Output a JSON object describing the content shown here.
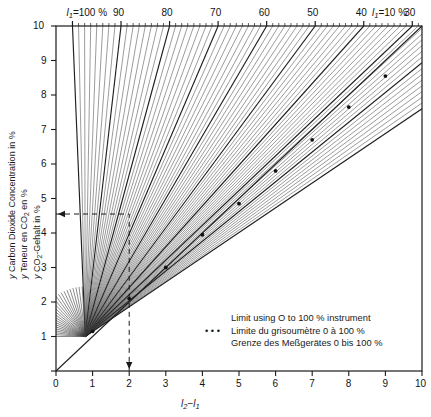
{
  "chart_data": {
    "type": "line",
    "title": "",
    "xlabel": "l2-l1",
    "ylabel": "y Carbon Dioxide Concentration in %",
    "xlim": [
      0,
      10
    ],
    "ylim": [
      0,
      10
    ],
    "grid": false,
    "x_ticks": [
      "0",
      "1",
      "2",
      "3",
      "4",
      "5",
      "6",
      "7",
      "8",
      "9",
      "10"
    ],
    "y_ticks": [
      "0",
      "1",
      "2",
      "3",
      "4",
      "5",
      "6",
      "7",
      "8",
      "9",
      "10"
    ],
    "top_axis_label_left": "l1=100 %",
    "top_axis_label_right": "l1=10 %",
    "top_ticks": [
      "90",
      "80",
      "70",
      "60",
      "50",
      "40",
      "30",
      "20"
    ],
    "top_tick_values": [
      90,
      80,
      70,
      60,
      50,
      40,
      30,
      20
    ],
    "fan_origin": [
      0.8,
      1.0
    ],
    "series": [
      {
        "name": "Limit using O to 100 % instrument",
        "style": "dotted-markers",
        "x": [
          1.0,
          2.0,
          3.0,
          4.0,
          5.0,
          6.0,
          7.0,
          8.0,
          9.0
        ],
        "y": [
          1.15,
          2.1,
          3.0,
          3.95,
          4.85,
          5.8,
          6.7,
          7.65,
          8.55
        ]
      }
    ],
    "construction_line": {
      "style": "dashed",
      "x_value": 2.0,
      "y_value": 4.55,
      "note": "dashed read-off from y-axis at 4.55 across to x = 2 then down to x-axis"
    },
    "l1_family_values": [
      100,
      95,
      90,
      85,
      80,
      75,
      70,
      65,
      60,
      55,
      50,
      45,
      40,
      35,
      30,
      25,
      20,
      15,
      10
    ]
  },
  "axes": {
    "y_title_lines": [
      "y Carbon Dioxide Concentration in %",
      "y Teneur en CO2 en %",
      "y CO2-Gehalt in %"
    ],
    "x_title": "l2-l1",
    "x_tick_labels": [
      "0",
      "1",
      "2",
      "3",
      "4",
      "5",
      "6",
      "7",
      "8",
      "9",
      "10"
    ],
    "y_tick_labels": [
      "1",
      "2",
      "3",
      "4",
      "5",
      "6",
      "7",
      "8",
      "9",
      "10"
    ],
    "top_left_label": "l1=100 %",
    "top_right_label": "l1=10 %",
    "top_tick_labels": [
      "90",
      "80",
      "70",
      "60",
      "50",
      "40",
      "30",
      "20"
    ]
  },
  "legend": {
    "marker": "dots",
    "lines": [
      "Limit using O to 100 % instrument",
      "Limite du grisoumètre 0 à 100 %",
      "Grenze des Meßgerätes 0 bis 100 %"
    ]
  },
  "colors": {
    "ink": "#1a1a1a",
    "line": "#2b2b2b",
    "thin_line": "#555555",
    "background": "#ffffff"
  }
}
